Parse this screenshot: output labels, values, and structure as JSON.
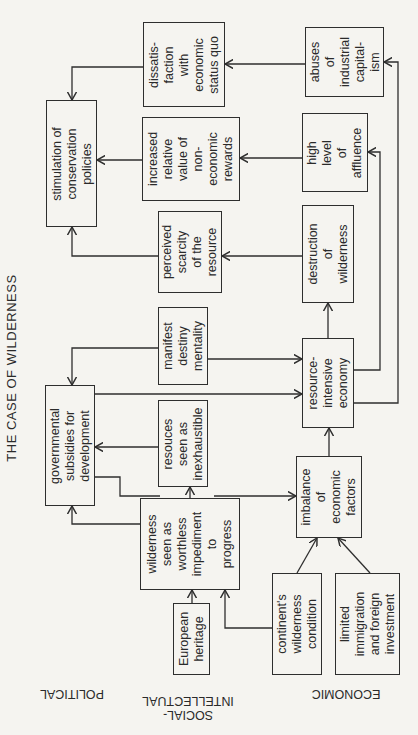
{
  "title": "THE CASE OF WILDERNESS",
  "row_labels": {
    "political": "POLITICAL",
    "social_intellectual": "SOCIAL-\nINTELLECTUAL",
    "economic": "ECONOMIC"
  },
  "nodes": {
    "stimulation": "stimulation of\nconservation\npolicies",
    "dissatisfaction": "dissatis-\nfaction\nwith\neconomic\nstatus quo",
    "increased_value": "increased\nrelative\nvalue of\nnon-\neconomic\nrewards",
    "perceived_scarcity": "perceived\nscarcity\nof the\nresource",
    "manifest_destiny": "manifest\ndestiny\nmentality",
    "governmental_subsidies": "governmental\nsubsidies for\ndevelopment",
    "resources_inexhaustible": "resouces\nseen as\ninexhaustible",
    "wilderness_worthless": "wilderness\nseen as\nworthless\nimpediment\nto\nprogress",
    "european_heritage": "European\nheritage",
    "abuses_capitalism": "abuses\nof\nindustrial\ncapital-\nism",
    "high_affluence": "high\nlevel\nof\naffluence",
    "destruction_wilderness": "destruction\nof\nwilderness",
    "resource_intensive": "resource-\nintensive\neconomy",
    "imbalance": "imbalance\nof\neconomic\nfactors",
    "continents_wilderness": "continent's\nwilderness\ncondition",
    "limited_immigration": "limited\nimmigration\nand foreign\ninvestment"
  },
  "edges": [
    [
      "european_heritage",
      "wilderness_worthless"
    ],
    [
      "continents_wilderness",
      "wilderness_worthless"
    ],
    [
      "continents_wilderness",
      "imbalance"
    ],
    [
      "limited_immigration",
      "imbalance"
    ],
    [
      "wilderness_worthless",
      "governmental_subsidies"
    ],
    [
      "wilderness_worthless",
      "resources_inexhaustible"
    ],
    [
      "wilderness_worthless",
      "imbalance"
    ],
    [
      "imbalance",
      "resource_intensive"
    ],
    [
      "governmental_subsidies",
      "resource_intensive"
    ],
    [
      "manifest_destiny",
      "governmental_subsidies"
    ],
    [
      "manifest_destiny",
      "resource_intensive"
    ],
    [
      "resource_intensive",
      "destruction_wilderness"
    ],
    [
      "resource_intensive",
      "high_affluence"
    ],
    [
      "resource_intensive",
      "abuses_capitalism"
    ],
    [
      "destruction_wilderness",
      "perceived_scarcity"
    ],
    [
      "high_affluence",
      "increased_value"
    ],
    [
      "abuses_capitalism",
      "dissatisfaction"
    ],
    [
      "perceived_scarcity",
      "stimulation"
    ],
    [
      "increased_value",
      "stimulation"
    ],
    [
      "dissatisfaction",
      "stimulation"
    ]
  ]
}
